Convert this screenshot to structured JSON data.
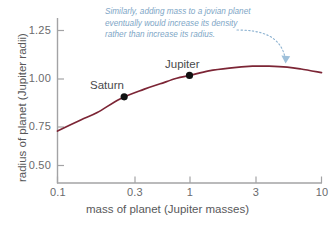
{
  "chart_data": {
    "type": "line",
    "title": "",
    "xlabel": "mass of planet (Jupiter masses)",
    "ylabel": "radius of planet (Jupiter radii)",
    "xscale": "log",
    "xlim": [
      0.1,
      10
    ],
    "ylim": [
      0.43,
      1.32
    ],
    "xticks": [
      "0.1",
      "0.3",
      "1",
      "3",
      "10"
    ],
    "xtick_values": [
      0.1,
      0.3,
      1,
      3,
      10
    ],
    "yticks": [
      "1.25",
      "1.00",
      "0.75",
      "0.50"
    ],
    "ytick_values": [
      1.25,
      1.0,
      0.75,
      0.5
    ],
    "grid": false,
    "legend": "none",
    "series": [
      {
        "name": "mass-radius relation for jovian planets",
        "color": "#7c2535",
        "x": [
          0.1,
          0.15,
          0.2,
          0.3,
          0.45,
          0.6,
          0.8,
          1.0,
          1.4,
          2.0,
          3.0,
          4.0,
          5.5,
          7.0,
          10.0
        ],
        "y": [
          0.71,
          0.77,
          0.81,
          0.885,
          0.935,
          0.965,
          0.995,
          1.01,
          1.035,
          1.05,
          1.06,
          1.06,
          1.055,
          1.045,
          1.025
        ]
      }
    ],
    "points": [
      {
        "name": "Saturn",
        "x": 0.32,
        "y": 0.895,
        "label": "Saturn",
        "marker": "circle",
        "color": "#111111"
      },
      {
        "name": "Jupiter",
        "x": 1.0,
        "y": 1.01,
        "label": "Jupiter",
        "marker": "circle",
        "color": "#111111"
      }
    ],
    "annotations": [
      {
        "name": "jovian-mass-density-note",
        "color": "#7ea6c6",
        "style": "italic",
        "lines": [
          "Similarly, adding mass to a jovian planet",
          "eventually would increase its density",
          "rather than increase its radius."
        ],
        "leader": {
          "style": "dotted",
          "arrow": true,
          "from_x": 4.0,
          "from_y": 1.22,
          "to_x": 5.4,
          "to_y": 1.085
        }
      }
    ]
  },
  "axis_color": "#9a9a9c",
  "background": "#ffffff"
}
